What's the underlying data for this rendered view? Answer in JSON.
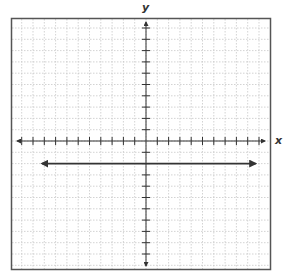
{
  "chart_data": {
    "type": "line",
    "title": "",
    "xlabel": "x",
    "ylabel": "y",
    "xlim": [
      -11,
      11
    ],
    "ylim": [
      -11,
      11
    ],
    "grid": true,
    "grid_style": "dotted",
    "tick_interval": 1,
    "tick_labels": false,
    "legend": null,
    "series": [
      {
        "name": "y = -2",
        "equation": "y = -2",
        "x": [
          -9.2,
          9.7
        ],
        "y": [
          -2,
          -2
        ],
        "arrows": "both",
        "color": "#333333"
      }
    ]
  },
  "colors": {
    "frame": "#555555",
    "grid": "#c8c8c8",
    "axis": "#333333",
    "line": "#333333"
  }
}
